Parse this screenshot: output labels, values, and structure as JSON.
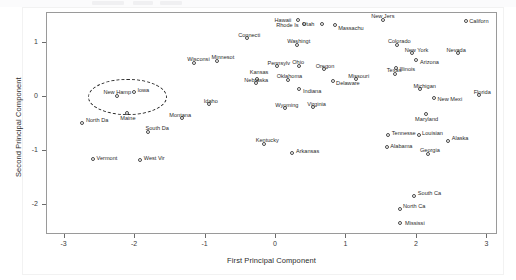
{
  "chart_data": {
    "type": "scatter",
    "title": "",
    "xlabel": "First Principal Component",
    "ylabel": "Second Principal Component",
    "xlim": [
      -3.25,
      3.15
    ],
    "ylim": [
      -2.55,
      1.55
    ],
    "xticks": [
      "-3",
      "-2",
      "-1",
      "0",
      "1",
      "2",
      "3"
    ],
    "xtick_values": [
      -3,
      -2,
      -1,
      0,
      1,
      2,
      3
    ],
    "yticks": [
      "1",
      "0",
      "-1",
      "-2"
    ],
    "ytick_values": [
      1,
      0,
      -1,
      -2
    ],
    "grid": false,
    "legend": "none",
    "marker": "open-circle",
    "points": [
      {
        "label": "Hawaii",
        "x": 0.32,
        "y": 1.42,
        "lx": -24,
        "ly": -3
      },
      {
        "label": "Rhode Is",
        "x": 0.4,
        "y": 1.33,
        "lx": -28,
        "ly": -3
      },
      {
        "label": "Utah",
        "x": 0.66,
        "y": 1.34,
        "lx": -20,
        "ly": -3
      },
      {
        "label": "Massachu",
        "x": 0.84,
        "y": 1.31,
        "lx": 3,
        "ly": -1
      },
      {
        "label": "New Jers",
        "x": 1.52,
        "y": 1.42,
        "lx": -12,
        "ly": -7
      },
      {
        "label": "Californ",
        "x": 2.7,
        "y": 1.4,
        "lx": 3,
        "ly": -3
      },
      {
        "label": "Connecti",
        "x": -0.41,
        "y": 1.07,
        "lx": -9,
        "ly": -7
      },
      {
        "label": "Washingt",
        "x": 0.3,
        "y": 0.95,
        "lx": -10,
        "ly": -7
      },
      {
        "label": "Colorado",
        "x": 1.73,
        "y": 0.95,
        "lx": -10,
        "ly": -7
      },
      {
        "label": "New York",
        "x": 1.94,
        "y": 0.8,
        "lx": -8,
        "ly": -7
      },
      {
        "label": "Nevada",
        "x": 2.59,
        "y": 0.8,
        "lx": -12,
        "ly": -7
      },
      {
        "label": "Wisconsi",
        "x": -1.16,
        "y": 0.62,
        "lx": -7,
        "ly": -7
      },
      {
        "label": "Minnesot",
        "x": -0.83,
        "y": 0.66,
        "lx": -6,
        "ly": -7
      },
      {
        "label": "Pennsylv",
        "x": 0.02,
        "y": 0.56,
        "lx": -10,
        "ly": -7
      },
      {
        "label": "Ohio",
        "x": 0.33,
        "y": 0.57,
        "lx": -7,
        "ly": -7
      },
      {
        "label": "Oregon",
        "x": 0.69,
        "y": 0.5,
        "lx": -9,
        "ly": -7
      },
      {
        "label": "Arizona",
        "x": 2.0,
        "y": 0.67,
        "lx": 3,
        "ly": -2
      },
      {
        "label": "Illinois",
        "x": 1.71,
        "y": 0.53,
        "lx": 3,
        "ly": -2
      },
      {
        "label": "Texas",
        "x": 1.7,
        "y": 0.42,
        "lx": -9,
        "ly": -7
      },
      {
        "label": "Kansas",
        "x": -0.26,
        "y": 0.33,
        "lx": -8,
        "ly": -10
      },
      {
        "label": "Nebraska",
        "x": -0.28,
        "y": 0.25,
        "lx": -12,
        "ly": -6
      },
      {
        "label": "Oklahoma",
        "x": 0.18,
        "y": 0.31,
        "lx": -12,
        "ly": -7
      },
      {
        "label": "Delaware",
        "x": 0.81,
        "y": 0.28,
        "lx": 3,
        "ly": -2
      },
      {
        "label": "Missouri",
        "x": 1.14,
        "y": 0.32,
        "lx": -8,
        "ly": -7
      },
      {
        "label": "New Hamp",
        "x": -2.25,
        "y": 0.01,
        "lx": -14,
        "ly": -7
      },
      {
        "label": "Iowa",
        "x": -2.01,
        "y": 0.09,
        "lx": 3,
        "ly": -5
      },
      {
        "label": "Indiana",
        "x": 0.34,
        "y": 0.13,
        "lx": 3,
        "ly": -2
      },
      {
        "label": "Michigan",
        "x": 2.05,
        "y": 0.13,
        "lx": -7,
        "ly": -7
      },
      {
        "label": "New Mexi",
        "x": 2.25,
        "y": -0.02,
        "lx": 3,
        "ly": -2
      },
      {
        "label": "Florida",
        "x": 2.89,
        "y": 0.02,
        "lx": -6,
        "ly": -7
      },
      {
        "label": "Idaho",
        "x": -0.94,
        "y": -0.14,
        "lx": -6,
        "ly": -7
      },
      {
        "label": "Wyoming",
        "x": 0.13,
        "y": -0.22,
        "lx": -10,
        "ly": -7
      },
      {
        "label": "Virginia",
        "x": 0.53,
        "y": -0.2,
        "lx": -6,
        "ly": -7
      },
      {
        "label": "Maine",
        "x": -2.11,
        "y": -0.3,
        "lx": -7,
        "ly": 2
      },
      {
        "label": "Montana",
        "x": -1.33,
        "y": -0.4,
        "lx": -13,
        "ly": -7
      },
      {
        "label": "Maryland",
        "x": 2.13,
        "y": -0.32,
        "lx": -11,
        "ly": 2
      },
      {
        "label": "North Da",
        "x": -2.74,
        "y": -0.49,
        "lx": 3,
        "ly": -6
      },
      {
        "label": "South Da",
        "x": -1.81,
        "y": -0.65,
        "lx": -3,
        "ly": -7
      },
      {
        "label": "Tennesse",
        "x": 1.6,
        "y": -0.72,
        "lx": 3,
        "ly": -6
      },
      {
        "label": "Louisian",
        "x": 2.03,
        "y": -0.72,
        "lx": 3,
        "ly": -6
      },
      {
        "label": "Alaska",
        "x": 2.45,
        "y": -0.82,
        "lx": 3,
        "ly": -6
      },
      {
        "label": "Kentucky",
        "x": -0.16,
        "y": -0.87,
        "lx": -9,
        "ly": -7
      },
      {
        "label": "Alabama",
        "x": 1.58,
        "y": -0.94,
        "lx": 3,
        "ly": -5
      },
      {
        "label": "Arkansas",
        "x": 0.24,
        "y": -1.04,
        "lx": 3,
        "ly": -5
      },
      {
        "label": "Georgia",
        "x": 2.17,
        "y": -1.06,
        "lx": -9,
        "ly": -7
      },
      {
        "label": "Vermont",
        "x": -2.59,
        "y": -1.16,
        "lx": 3,
        "ly": -5
      },
      {
        "label": "West Vir",
        "x": -1.92,
        "y": -1.17,
        "lx": 3,
        "ly": -5
      },
      {
        "label": "South Ca",
        "x": 1.97,
        "y": -1.83,
        "lx": 3,
        "ly": -6
      },
      {
        "label": "North Ca",
        "x": 1.76,
        "y": -2.07,
        "lx": 3,
        "ly": -6
      },
      {
        "label": "Mississi",
        "x": 1.76,
        "y": -2.33,
        "lx": 5,
        "ly": -3
      }
    ],
    "annotations": [
      {
        "name": "highlight-ellipse",
        "shape": "dashed-ellipse",
        "center_x": -2.12,
        "center_y": 0.02,
        "radius_x": 0.55,
        "radius_y": 0.32
      }
    ]
  }
}
